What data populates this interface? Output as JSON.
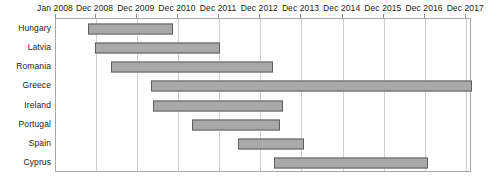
{
  "chart_data": {
    "type": "bar",
    "subtype": "gantt",
    "title": "",
    "xlabel": "",
    "ylabel": "",
    "grid": true,
    "legend": "none",
    "orientation": "horizontal",
    "x_axis": {
      "position": "top",
      "tick_labels": [
        "Jan 2008",
        "Dec 2008",
        "Dec 2009",
        "Dec 2010",
        "Dec 2011",
        "Dec 2012",
        "Dec 2013",
        "Dec 2014",
        "Dec 2015",
        "Dec 2016",
        "Dec 2017"
      ],
      "tick_values": [
        2008.0,
        2008.96,
        2009.96,
        2010.96,
        2011.96,
        2012.96,
        2013.96,
        2014.96,
        2015.96,
        2016.96,
        2017.96
      ],
      "xlim": [
        2008.0,
        2018.1
      ]
    },
    "categories": [
      "Hungary",
      "Latvia",
      "Romania",
      "Greece",
      "Ireland",
      "Portugal",
      "Spain",
      "Cyprus"
    ],
    "bars": [
      {
        "category": "Hungary",
        "start": 2008.78,
        "end": 2010.85,
        "start_label": "Oct 2008",
        "end_label": "Oct 2010"
      },
      {
        "category": "Latvia",
        "end": 2011.99,
        "start": 2008.95,
        "start_label": "Dec 2008",
        "end_label": "Dec 2011"
      },
      {
        "category": "Romania",
        "start": 2009.34,
        "end": 2013.28,
        "start_label": "Apr 2009",
        "end_label": "Apr 2013"
      },
      {
        "category": "Greece",
        "start": 2010.31,
        "end": 2018.09,
        "start_label": "Apr 2010",
        "end_label": "Jan 2018"
      },
      {
        "category": "Ireland",
        "start": 2010.36,
        "end": 2013.5,
        "start_label": "Apr 2010",
        "end_label": "Jul 2013"
      },
      {
        "category": "Portugal",
        "start": 2011.31,
        "end": 2013.43,
        "start_label": "Apr 2011",
        "end_label": "Jun 2013"
      },
      {
        "category": "Spain",
        "start": 2012.41,
        "end": 2014.02,
        "start_label": "May 2012",
        "end_label": "Jan 2014"
      },
      {
        "category": "Cyprus",
        "start": 2013.3,
        "end": 2017.02,
        "start_label": "Apr 2013",
        "end_label": "Jan 2017"
      }
    ],
    "colors": {
      "bar_fill": "#a9a9a9",
      "bar_border": "#5e5e5e",
      "gridline": "#cfcfcf",
      "frame": "#a8a8a8",
      "text": "#1a1a1a",
      "background": "#ffffff"
    }
  }
}
